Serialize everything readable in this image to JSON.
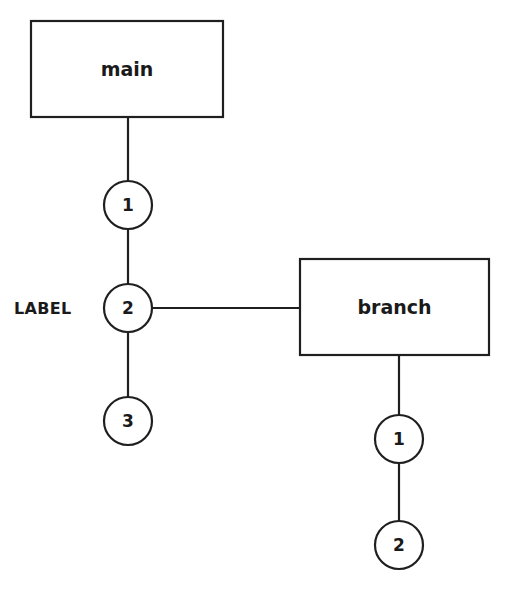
{
  "diagram": {
    "type": "git-branch-graph",
    "background_color": "#ffffff",
    "stroke_color": "#1f1f1f",
    "text_color": "#1a1a1a",
    "stroke_width": 2.2,
    "branches": [
      {
        "id": "main",
        "name": "main",
        "box": {
          "x": 31,
          "y": 21,
          "width": 192,
          "height": 96
        },
        "commits": [
          {
            "label": "1",
            "cx": 128,
            "cy": 205,
            "r": 24
          },
          {
            "label": "2",
            "cx": 128,
            "cy": 308,
            "r": 24
          },
          {
            "label": "3",
            "cx": 128,
            "cy": 421,
            "r": 24
          }
        ]
      },
      {
        "id": "branch",
        "name": "branch",
        "box": {
          "x": 300,
          "y": 259,
          "width": 189,
          "height": 96
        },
        "commits": [
          {
            "label": "1",
            "cx": 399,
            "cy": 439,
            "r": 24
          },
          {
            "label": "2",
            "cx": 399,
            "cy": 545,
            "r": 24
          }
        ]
      }
    ],
    "annotations": [
      {
        "id": "label-marker",
        "text": "LABEL",
        "x": 14,
        "y": 308
      }
    ],
    "edges": [
      {
        "id": "main-box-to-commit-1",
        "x1": 128,
        "y1": 117,
        "x2": 128,
        "y2": 181
      },
      {
        "id": "main-commit-1-to-2",
        "x1": 128,
        "y1": 229,
        "x2": 128,
        "y2": 284
      },
      {
        "id": "main-commit-2-to-3",
        "x1": 128,
        "y1": 332,
        "x2": 128,
        "y2": 397
      },
      {
        "id": "main-commit-2-to-branch-box",
        "x1": 152,
        "y1": 308,
        "x2": 300,
        "y2": 308
      },
      {
        "id": "branch-box-to-commit-1",
        "x1": 399,
        "y1": 355,
        "x2": 399,
        "y2": 415
      },
      {
        "id": "branch-commit-1-to-2",
        "x1": 399,
        "y1": 463,
        "x2": 399,
        "y2": 521
      }
    ]
  }
}
